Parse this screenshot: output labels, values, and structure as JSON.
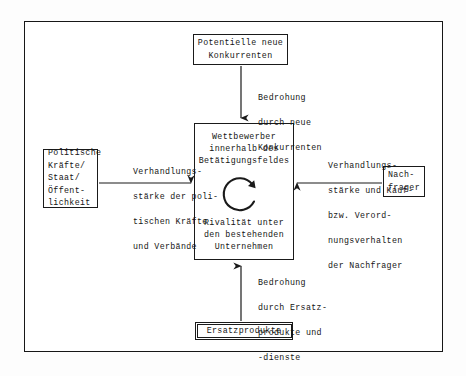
{
  "figure": {
    "frame_color": "#171717",
    "text_color": "#151515"
  },
  "boxes": {
    "new_entrants": {
      "name": "Potentielle neue Konkurrenten",
      "lines": [
        "Potentielle neue",
        "Konkurrenten"
      ]
    },
    "competitors": {
      "name": "Wettbewerber innerhalb des Betätigungsfeldes",
      "top_lines": [
        "Wettbewerber",
        "innerhalb des",
        "Betätigungsfeldes"
      ],
      "bottom_lines": [
        "Rivalität unter",
        "den bestehenden",
        "Unternehmen"
      ],
      "cycle_icon": "circular-arrow-icon"
    },
    "political": {
      "name": "Politische Kräfte / Staat / Öffentlichkeit",
      "lines": [
        "Politische",
        "Kräfte/",
        "Staat/",
        "Öffent-",
        "lichkeit"
      ]
    },
    "buyers": {
      "name": "Nachfrager",
      "lines": [
        "Nach-",
        "frager"
      ]
    },
    "substitutes": {
      "name": "Ersatzprodukte",
      "lines": [
        "Ersatzprodukte"
      ]
    }
  },
  "arrow_labels": {
    "threat_entrants": {
      "lines": [
        "Bedrohung",
        "durch neue",
        "Konkurrenten"
      ]
    },
    "threat_substitutes": {
      "lines": [
        "Bedrohung",
        "durch Ersatz-",
        "produkte und",
        "-dienste"
      ]
    },
    "political_power": {
      "lines": [
        "Verhandlungs-",
        "stärke der poli-",
        "tischen Kräfte",
        "und Verbände"
      ]
    },
    "buyer_power": {
      "lines": [
        "Verhandlungs-",
        "stärke und Kauf-",
        "bzw. Verord-",
        "nungsverhalten",
        "der Nachfrager"
      ]
    }
  },
  "arrows": [
    {
      "name": "arrow-entrants-to-center",
      "direction": "down"
    },
    {
      "name": "arrow-substitutes-to-center",
      "direction": "up"
    },
    {
      "name": "arrow-political-to-center",
      "direction": "right"
    },
    {
      "name": "arrow-buyers-to-center",
      "direction": "left"
    }
  ]
}
